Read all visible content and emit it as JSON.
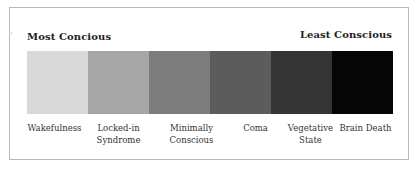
{
  "diagram": {
    "left_label": "Most Concious",
    "right_label": "Least Conscious",
    "states": [
      {
        "label": "Wakefulness",
        "color": "#d9d9d9"
      },
      {
        "label": "Locked-in Syndrome",
        "color": "#a6a6a6"
      },
      {
        "label": "Minimally Conscious",
        "color": "#7c7c7c"
      },
      {
        "label": "Coma",
        "color": "#5c5c5c"
      },
      {
        "label": "Vegetative State",
        "color": "#343434"
      },
      {
        "label": "Brain Death",
        "color": "#050505"
      }
    ]
  },
  "colors": {
    "frame_border": "#b9b9b9",
    "background": "#ffffff",
    "text": "#2a2a2a"
  }
}
